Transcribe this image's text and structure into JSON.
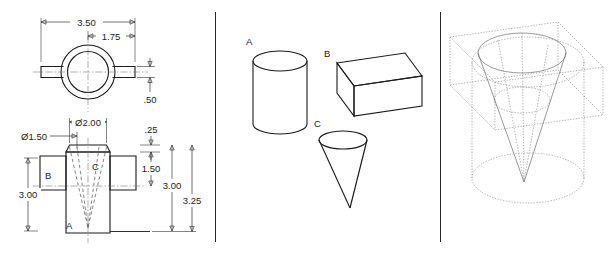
{
  "drawing": {
    "title": "Engineering drawing - orthographic views, primitive solids and wireframe assembly",
    "panels": [
      {
        "name": "orthographic-views"
      },
      {
        "name": "primitive-solids"
      },
      {
        "name": "wireframe-assembly"
      }
    ]
  },
  "top_view": {
    "name": "top-view",
    "dimensions": [
      {
        "id": "overall_width",
        "value": "3.50"
      },
      {
        "id": "tab_to_center",
        "value": "1.75"
      },
      {
        "id": "tab_thickness",
        "value": ".50"
      }
    ]
  },
  "front_view": {
    "name": "front-view",
    "dimensions": [
      {
        "id": "cone_top_dia",
        "value": "Ø2.00"
      },
      {
        "id": "bore_dia",
        "value": "Ø1.50"
      },
      {
        "id": "top_step",
        "value": ".25"
      },
      {
        "id": "block_height",
        "value": "1.50"
      },
      {
        "id": "block_width_left",
        "value": "3.00"
      },
      {
        "id": "cyl_height",
        "value": "3.00"
      },
      {
        "id": "overall_height",
        "value": "3.25"
      }
    ],
    "part_labels": [
      {
        "id": "part-a",
        "value": "A"
      },
      {
        "id": "part-b",
        "value": "B"
      },
      {
        "id": "part-c",
        "value": "C"
      }
    ]
  },
  "primitives": {
    "name": "primitive-solids",
    "items": [
      {
        "id": "cylinder",
        "label": "A",
        "shape": "cylinder"
      },
      {
        "id": "rectangular-block",
        "label": "B",
        "shape": "rectangular-prism"
      },
      {
        "id": "cone",
        "label": "C",
        "shape": "cone"
      }
    ]
  },
  "assembly": {
    "name": "wireframe-assembly",
    "components": [
      "cylinder",
      "rectangular-block",
      "cone"
    ]
  },
  "colors": {
    "line": "#1a1a1a",
    "hidden": "#555555",
    "center": "#777777",
    "wireframe": "#8a8a8a",
    "background": "#ffffff"
  }
}
